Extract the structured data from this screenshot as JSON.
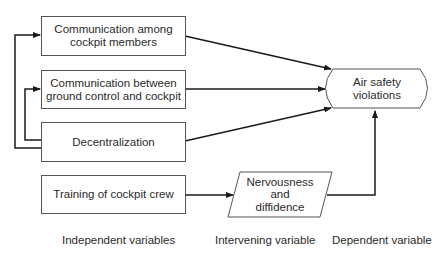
{
  "diagram": {
    "independent_variables": [
      {
        "id": "comm-cockpit",
        "line1": "Communication among",
        "line2": "cockpit members"
      },
      {
        "id": "comm-ground",
        "line1": "Communication between",
        "line2": "ground control and cockpit"
      },
      {
        "id": "decentralization",
        "line1": "Decentralization",
        "line2": ""
      },
      {
        "id": "training",
        "line1": "Training of cockpit crew",
        "line2": ""
      }
    ],
    "intervening_variable": {
      "line1": "Nervousness",
      "line2": "and",
      "line3": "diffidence"
    },
    "dependent_variable": {
      "line1": "Air safety",
      "line2": "violations"
    },
    "column_labels": {
      "independent": "Independent variables",
      "intervening": "Intervening variable",
      "dependent": "Dependent variable"
    },
    "colors": {
      "line": "#1a1a1a",
      "border": "#555555",
      "text": "#2a2a2a"
    }
  }
}
